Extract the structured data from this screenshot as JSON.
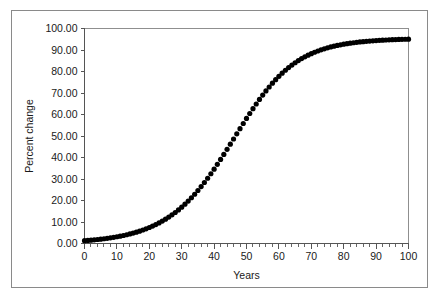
{
  "chart_data": {
    "type": "scatter",
    "title": "",
    "xlabel": "Years",
    "ylabel": "Percent change",
    "xlim": [
      0,
      100
    ],
    "ylim": [
      0,
      100
    ],
    "grid": false,
    "legend": null,
    "x_ticks": [
      0,
      10,
      20,
      30,
      40,
      50,
      60,
      70,
      80,
      90,
      100
    ],
    "x_tick_labels": [
      "0",
      "10",
      "20",
      "30",
      "40",
      "50",
      "60",
      "70",
      "80",
      "90",
      "100"
    ],
    "x_minor_tick_step": 2,
    "y_ticks": [
      0,
      10,
      20,
      30,
      40,
      50,
      60,
      70,
      80,
      90,
      100
    ],
    "y_tick_labels": [
      "0.00",
      "10.00",
      "20.00",
      "30.00",
      "40.00",
      "50.00",
      "60.00",
      "70.00",
      "80.00",
      "90.00",
      "100.00"
    ],
    "marker": "filled-circle",
    "marker_color": "#000000",
    "marker_size": 2.6,
    "series": [
      {
        "name": "Percent change",
        "x": [
          0,
          1,
          2,
          3,
          4,
          5,
          6,
          7,
          8,
          9,
          10,
          11,
          12,
          13,
          14,
          15,
          16,
          17,
          18,
          19,
          20,
          21,
          22,
          23,
          24,
          25,
          26,
          27,
          28,
          29,
          30,
          31,
          32,
          33,
          34,
          35,
          36,
          37,
          38,
          39,
          40,
          41,
          42,
          43,
          44,
          45,
          46,
          47,
          48,
          49,
          50,
          51,
          52,
          53,
          54,
          55,
          56,
          57,
          58,
          59,
          60,
          61,
          62,
          63,
          64,
          65,
          66,
          67,
          68,
          69,
          70,
          71,
          72,
          73,
          74,
          75,
          76,
          77,
          78,
          79,
          80,
          81,
          82,
          83,
          84,
          85,
          86,
          87,
          88,
          89,
          90,
          91,
          92,
          93,
          94,
          95,
          96,
          97,
          98,
          99,
          100
        ],
        "values": [
          1.3,
          1.42,
          1.55,
          1.69,
          1.85,
          2.02,
          2.21,
          2.41,
          2.63,
          2.87,
          3.13,
          3.42,
          3.73,
          4.07,
          4.44,
          4.84,
          5.28,
          5.75,
          6.27,
          6.83,
          7.44,
          8.1,
          8.81,
          9.58,
          10.41,
          11.31,
          12.28,
          13.32,
          14.43,
          15.63,
          16.91,
          18.28,
          19.73,
          21.28,
          22.91,
          24.64,
          26.46,
          28.37,
          30.36,
          32.44,
          34.59,
          36.81,
          39.09,
          41.42,
          43.79,
          46.19,
          48.6,
          51.02,
          53.43,
          55.81,
          58.16,
          60.46,
          62.71,
          64.89,
          67.0,
          69.02,
          70.96,
          72.8,
          74.55,
          76.2,
          77.76,
          79.21,
          80.57,
          81.83,
          83.0,
          84.08,
          85.08,
          85.99,
          86.84,
          87.61,
          88.31,
          88.95,
          89.54,
          90.07,
          90.56,
          91.0,
          91.41,
          91.77,
          92.11,
          92.41,
          92.69,
          92.94,
          93.17,
          93.38,
          93.56,
          93.74,
          93.89,
          94.03,
          94.16,
          94.28,
          94.38,
          94.48,
          94.57,
          94.65,
          94.72,
          94.79,
          94.85,
          94.9,
          94.95,
          95.0,
          95.04
        ]
      }
    ],
    "curve_description": "logistic sigmoid growth curve"
  }
}
